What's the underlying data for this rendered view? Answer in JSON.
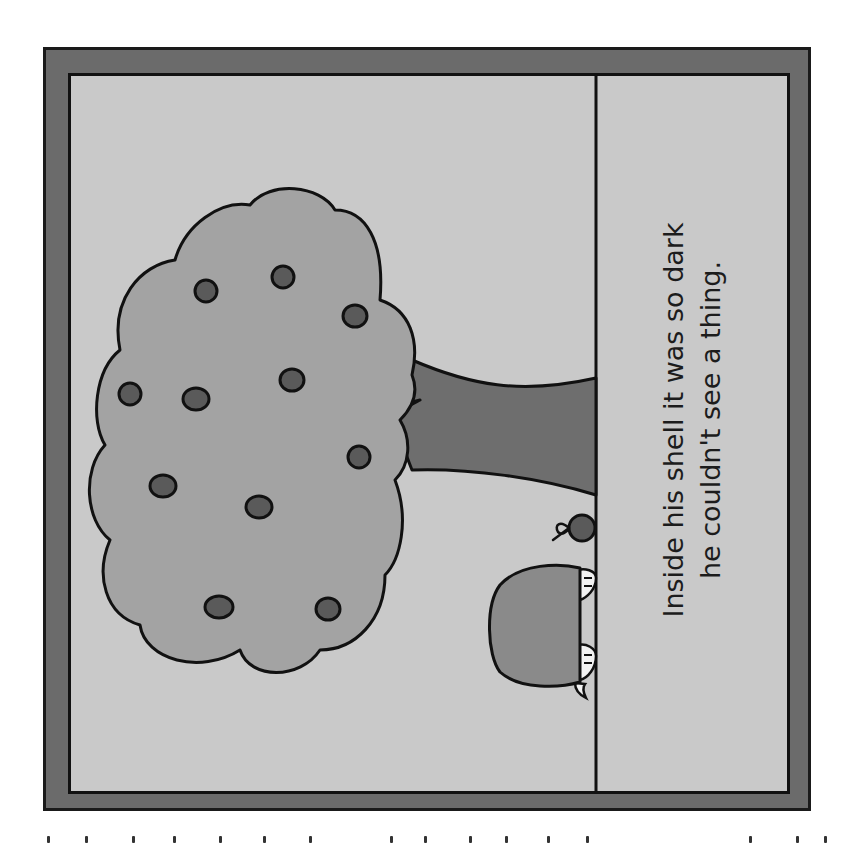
{
  "illustration": {
    "type": "picture-book-page",
    "orientation": "rotated-90",
    "caption": {
      "line1": "Inside his shell it was so dark",
      "line2": "he couldn't see a thing."
    },
    "scene": {
      "elements": [
        "tree",
        "fruit",
        "turtle-shell",
        "apple",
        "ground-line"
      ],
      "fruit_count": 10
    },
    "colors": {
      "outer_frame": "#6b6b6b",
      "inner_panel": "#c9c9c9",
      "canopy": "#a3a3a3",
      "trunk": "#6e6e6e",
      "fruit": "#5a5a5a",
      "shell": "#8a8a8a",
      "outline": "#111111"
    }
  },
  "ticks": {
    "count": 16,
    "positions": [
      30,
      55,
      85,
      111,
      141,
      169,
      199,
      251,
      273,
      302,
      325,
      352,
      377,
      482,
      512,
      530
    ]
  }
}
